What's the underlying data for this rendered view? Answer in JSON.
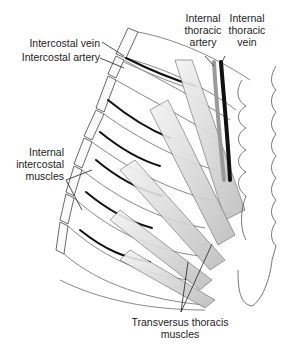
{
  "diagram": {
    "type": "anatomical illustration",
    "labels": {
      "intercostal_vein": "Intercostal vein",
      "intercostal_artery": "Intercostal artery",
      "internal_thoracic_artery": [
        "Internal",
        "thoracic",
        "artery"
      ],
      "internal_thoracic_vein": [
        "Internal",
        "thoracic",
        "vein"
      ],
      "internal_intercostal_muscles": [
        "Internal",
        "intercostal",
        "muscles"
      ],
      "transversus_thoracis_muscles": [
        "Transversus thoracis",
        "muscles"
      ]
    },
    "colors": {
      "line": "#333333",
      "artery": "#9a9a9a",
      "vein": "#111111",
      "muscle_shade": "#c8c8c8"
    }
  }
}
